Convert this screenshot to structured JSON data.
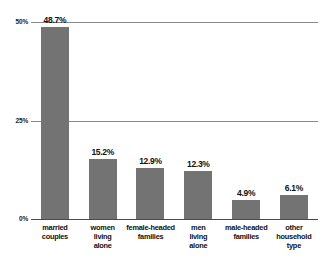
{
  "chart_data": {
    "type": "bar",
    "title": "",
    "xlabel": "",
    "ylabel": "",
    "ylim": [
      0,
      50
    ],
    "grid": true,
    "legend": null,
    "categories": [
      "married couples",
      "women living alone",
      "female-headed families",
      "men living alone",
      "male-headed families",
      "other household type"
    ],
    "values": [
      48.7,
      15.2,
      12.9,
      12.3,
      4.9,
      6.1
    ],
    "value_labels": [
      "48.7%",
      "15.2%",
      "12.9%",
      "12.3%",
      "4.9%",
      "6.1%"
    ],
    "ytick_values": [
      0,
      25,
      50
    ],
    "ytick_labels": [
      "0%",
      "25%",
      "50%"
    ],
    "colors": {
      "bar_fill": "#737373",
      "gridline": "#8a8a8a",
      "baseline": "#4a4a4a",
      "text": "#111111",
      "background": "#ffffff"
    }
  },
  "category_lines": [
    [
      "married",
      "couples"
    ],
    [
      "women",
      "living",
      "alone"
    ],
    [
      "female-headed",
      "families"
    ],
    [
      "men",
      "living",
      "alone"
    ],
    [
      "male-headed",
      "families"
    ],
    [
      "other",
      "household",
      "type"
    ]
  ]
}
